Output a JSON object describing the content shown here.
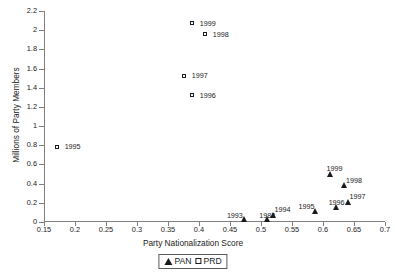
{
  "chart_data": {
    "type": "scatter",
    "title": "",
    "xlabel": "Party Nationalization Score",
    "ylabel": "Millions of Party Members",
    "xlim": [
      0.15,
      0.7
    ],
    "ylim": [
      0,
      2.2
    ],
    "xticks": [
      "0.15",
      "0.2",
      "0.25",
      "0.3",
      "0.35",
      "0.4",
      "0.45",
      "0.5",
      "0.55",
      "0.6",
      "0.65",
      "0.7"
    ],
    "yticks": [
      "0",
      "0.2",
      "0.4",
      "0.6",
      "0.8",
      "1",
      "1.2",
      "1.4",
      "1.6",
      "1.8",
      "2",
      "2.2"
    ],
    "grid": false,
    "legend_position": "bottom-center",
    "series": [
      {
        "name": "PAN",
        "marker": "filled-triangle",
        "color": "#1a1a1a",
        "points": [
          {
            "label": "1993",
            "x": 0.474,
            "y": 0.005,
            "label_dx": -18,
            "label_dy": -10
          },
          {
            "label": "1982",
            "x": 0.51,
            "y": 0.005,
            "label_dx": -8,
            "label_dy": -10
          },
          {
            "label": "1994",
            "x": 0.52,
            "y": 0.045,
            "label_dx": 1,
            "label_dy": -12
          },
          {
            "label": "1995",
            "x": 0.588,
            "y": 0.085,
            "label_dx": -17,
            "label_dy": -11
          },
          {
            "label": "1996",
            "x": 0.622,
            "y": 0.12,
            "label_dx": -8,
            "label_dy": -11
          },
          {
            "label": "1997",
            "x": 0.641,
            "y": 0.18,
            "label_dx": 1,
            "label_dy": -12
          },
          {
            "label": "1998",
            "x": 0.634,
            "y": 0.35,
            "label_dx": 2,
            "label_dy": -11
          },
          {
            "label": "1999",
            "x": 0.612,
            "y": 0.47,
            "label_dx": -4,
            "label_dy": -12
          }
        ]
      },
      {
        "name": "PRD",
        "marker": "open-square",
        "color": "#1a1a1a",
        "points": [
          {
            "label": "1995",
            "x": 0.172,
            "y": 0.78,
            "label_dx": 7,
            "label_dy": -4
          },
          {
            "label": "1996",
            "x": 0.39,
            "y": 1.315,
            "label_dx": 7,
            "label_dy": -4
          },
          {
            "label": "1997",
            "x": 0.377,
            "y": 1.52,
            "label_dx": 7,
            "label_dy": -4
          },
          {
            "label": "1998",
            "x": 0.411,
            "y": 1.95,
            "label_dx": 7,
            "label_dy": -4
          },
          {
            "label": "1999",
            "x": 0.39,
            "y": 2.065,
            "label_dx": 7,
            "label_dy": -4
          }
        ]
      }
    ],
    "legend": [
      {
        "name": "PAN",
        "marker": "filled-triangle"
      },
      {
        "name": "PRD",
        "marker": "open-square"
      }
    ]
  }
}
